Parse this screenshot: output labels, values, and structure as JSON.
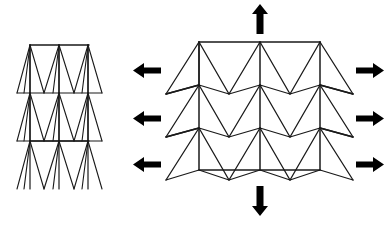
{
  "figure": {
    "background_color": "#ffffff",
    "line_color": "#1a1a1a",
    "arrow_color": "#000000",
    "canvas": {
      "width": 388,
      "height": 225
    }
  },
  "panels": [
    {
      "id": "left-panel",
      "name": "compressed-lattice",
      "label": "",
      "state": "compressed",
      "bounds": {
        "x": 14,
        "y": 40,
        "width": 112,
        "height": 145
      },
      "columns": 3,
      "rows": 4,
      "geometry": {
        "top_bar": {
          "x1": 30,
          "y1": 45,
          "x2": 89,
          "y2": 45
        },
        "mid_bar": {
          "x1": 30,
          "y1": 141,
          "x2": 89,
          "y2": 141
        },
        "column_x": [
          30,
          59,
          88
        ],
        "row_y": [
          45,
          93,
          141,
          189
        ],
        "zig_amplitude": 9,
        "reentrant_depth": 38
      }
    },
    {
      "id": "right-panel",
      "name": "expanded-lattice",
      "label": "",
      "state": "expanded",
      "bounds": {
        "x": 166,
        "y": 18,
        "width": 190,
        "height": 190
      },
      "columns": 3,
      "rows": 3,
      "geometry": {
        "top_bar": {
          "x1": 199,
          "y1": 42,
          "x2": 320,
          "y2": 42
        },
        "bottom_bar": {
          "x1": 199,
          "y1": 170,
          "x2": 320,
          "y2": 170
        },
        "column_x": [
          199,
          260,
          320
        ],
        "row_y": [
          42,
          85,
          128,
          170
        ],
        "zig_amplitude": 9,
        "reentrant_depth": 35
      }
    }
  ],
  "arrows": {
    "vertical": [
      {
        "name": "top-load-arrow",
        "direction": "up",
        "x": 260,
        "from_y": 34,
        "to_y": 6
      },
      {
        "name": "bottom-load-arrow",
        "direction": "down",
        "x": 260,
        "from_y": 186,
        "to_y": 214
      }
    ],
    "horizontal_left": [
      {
        "name": "left-load-arrow-1",
        "direction": "left",
        "y": 70,
        "from_x": 160,
        "to_x": 134
      },
      {
        "name": "left-load-arrow-2",
        "direction": "left",
        "y": 118,
        "from_x": 160,
        "to_x": 134
      },
      {
        "name": "left-load-arrow-3",
        "direction": "left",
        "y": 164,
        "from_x": 160,
        "to_x": 134
      }
    ],
    "horizontal_right": [
      {
        "name": "right-load-arrow-1",
        "direction": "right",
        "y": 70,
        "from_x": 355,
        "to_x": 381
      },
      {
        "name": "right-load-arrow-2",
        "direction": "right",
        "y": 118,
        "from_x": 355,
        "to_x": 381
      },
      {
        "name": "right-load-arrow-3",
        "direction": "right",
        "y": 164,
        "from_x": 355,
        "to_x": 381
      }
    ]
  },
  "stroke_widths": {
    "frame": 1.5,
    "diagonal": 1.2,
    "thin": 1.0
  }
}
